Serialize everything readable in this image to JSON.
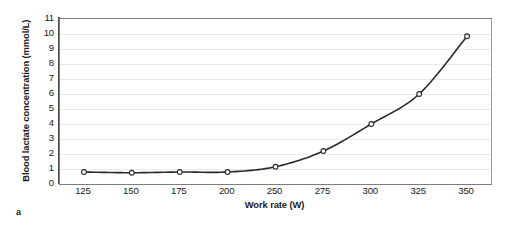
{
  "figure": {
    "panel_caption": "a",
    "background_color": "#ffffff",
    "frame_color": "#7d7d7d",
    "axis_color": "#4a4a4a",
    "gridline_color": "#e9e9e9"
  },
  "chart_data": {
    "type": "line",
    "title": "",
    "xlabel": "Work rate (W)",
    "ylabel": "Blood lactate concentration (mmol/L)",
    "categories": [
      "125",
      "150",
      "175",
      "200",
      "250",
      "275",
      "300",
      "325",
      "350"
    ],
    "x": [
      125,
      150,
      175,
      200,
      250,
      275,
      300,
      325,
      350
    ],
    "values": [
      0.8,
      0.75,
      0.8,
      0.8,
      1.15,
      2.2,
      4.0,
      6.0,
      9.85
    ],
    "series": [
      {
        "name": "Blood lactate",
        "values": [
          0.8,
          0.75,
          0.8,
          0.8,
          1.15,
          2.2,
          4.0,
          6.0,
          9.85
        ],
        "line_color": "#2a2a2a",
        "marker": "open-circle",
        "marker_face_color": "#ffffff",
        "marker_edge_color": "#2a2a2a"
      }
    ],
    "yticks": [
      0,
      1,
      2,
      3,
      4,
      5,
      6,
      7,
      8,
      9,
      10,
      11
    ],
    "ytick_labels": [
      "0",
      "1",
      "2",
      "3",
      "4",
      "5",
      "6",
      "7",
      "8",
      "9",
      "10",
      "11"
    ],
    "ylim": [
      0,
      11
    ],
    "xlim_categorical": true,
    "grid": "horizontal",
    "legend": "none"
  }
}
